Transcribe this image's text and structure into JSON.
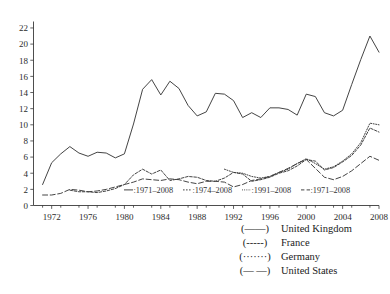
{
  "chart_data": {
    "type": "line",
    "title": "",
    "xlabel": "",
    "ylabel": "",
    "xlim": [
      1970,
      2008
    ],
    "ylim": [
      0,
      22.8
    ],
    "grid": false,
    "legend_position": "bottom-right, outside plot",
    "x_ticks": [
      1972,
      1976,
      1980,
      1984,
      1988,
      1992,
      1996,
      2000,
      2004,
      2008
    ],
    "y_ticks": [
      0,
      2,
      4,
      6,
      8,
      10,
      12,
      14,
      16,
      18,
      20,
      22
    ],
    "x": [
      1970,
      1971,
      1972,
      1973,
      1974,
      1975,
      1976,
      1977,
      1978,
      1979,
      1980,
      1981,
      1982,
      1983,
      1984,
      1985,
      1986,
      1987,
      1988,
      1989,
      1990,
      1991,
      1992,
      1993,
      1994,
      1995,
      1996,
      1997,
      1998,
      1999,
      2000,
      2001,
      2002,
      2003,
      2004,
      2005,
      2006,
      2007,
      2008
    ],
    "series": [
      {
        "name": "United Kingdom",
        "style": "solid",
        "range": "1971-2008",
        "start_year": 1971,
        "values": [
          null,
          2.6,
          5.3,
          6.4,
          7.3,
          6.5,
          6.1,
          6.6,
          6.5,
          5.9,
          6.4,
          10.1,
          14.4,
          15.6,
          13.7,
          15.4,
          14.5,
          12.4,
          11.1,
          11.6,
          13.9,
          13.8,
          13.0,
          10.9,
          11.5,
          10.9,
          12.1,
          12.1,
          11.9,
          11.2,
          13.8,
          13.5,
          11.5,
          11.1,
          11.8,
          15.0,
          18.1,
          21.0,
          19.0
        ]
      },
      {
        "name": "France",
        "style": "dashed-dotted",
        "range": "1974-2008",
        "start_year": 1974,
        "values": [
          null,
          null,
          null,
          null,
          1.9,
          1.7,
          1.7,
          1.6,
          1.8,
          2.1,
          2.6,
          3.8,
          4.5,
          3.9,
          4.4,
          3.1,
          3.3,
          3.6,
          3.5,
          3.1,
          3.0,
          3.4,
          4.1,
          3.9,
          3.0,
          3.2,
          3.5,
          4.0,
          4.3,
          4.9,
          5.7,
          5.5,
          4.4,
          4.7,
          5.4,
          6.2,
          7.5,
          9.6,
          9.1
        ]
      },
      {
        "name": "Germany",
        "style": "dotted",
        "range": "1991-2008",
        "start_year": 1991,
        "values": [
          null,
          null,
          null,
          null,
          null,
          null,
          null,
          null,
          null,
          null,
          null,
          null,
          null,
          null,
          null,
          null,
          null,
          null,
          null,
          null,
          null,
          4.5,
          4.1,
          4.0,
          3.6,
          3.4,
          3.6,
          4.1,
          4.5,
          5.2,
          5.8,
          5.2,
          4.5,
          4.8,
          5.5,
          6.4,
          7.8,
          10.2,
          10.0
        ]
      },
      {
        "name": "United States",
        "style": "long-dashed",
        "range": "1971-2008",
        "start_year": 1971,
        "values": [
          null,
          1.3,
          1.3,
          1.5,
          2.0,
          1.9,
          1.7,
          1.8,
          2.0,
          2.3,
          2.6,
          2.9,
          3.3,
          3.2,
          3.1,
          3.3,
          3.2,
          2.9,
          2.7,
          3.0,
          3.0,
          2.9,
          2.3,
          2.6,
          3.1,
          3.3,
          3.6,
          4.1,
          4.6,
          5.2,
          5.7,
          4.6,
          3.5,
          3.2,
          3.6,
          4.3,
          5.2,
          6.1,
          5.6
        ]
      }
    ],
    "inplot_legend": [
      {
        "key": "—",
        "label": ":1971–2008"
      },
      {
        "key": "----",
        "label": ":1974–2008"
      },
      {
        "key": "·····",
        "label": ":1991–2008"
      },
      {
        "key": "- -",
        "label": ":1971–2008"
      }
    ]
  },
  "legend": {
    "entries": [
      {
        "key": "(——)",
        "name": "United Kingdom"
      },
      {
        "key": "(-----)",
        "name": "France"
      },
      {
        "key": "(·······)",
        "name": "Germany"
      },
      {
        "key": "(— —)",
        "name": "United States"
      }
    ]
  },
  "colors": {
    "line": "#3a3a3a",
    "axis": "#3a3a3a",
    "text": "#1a1a1a",
    "background": "#ffffff"
  }
}
